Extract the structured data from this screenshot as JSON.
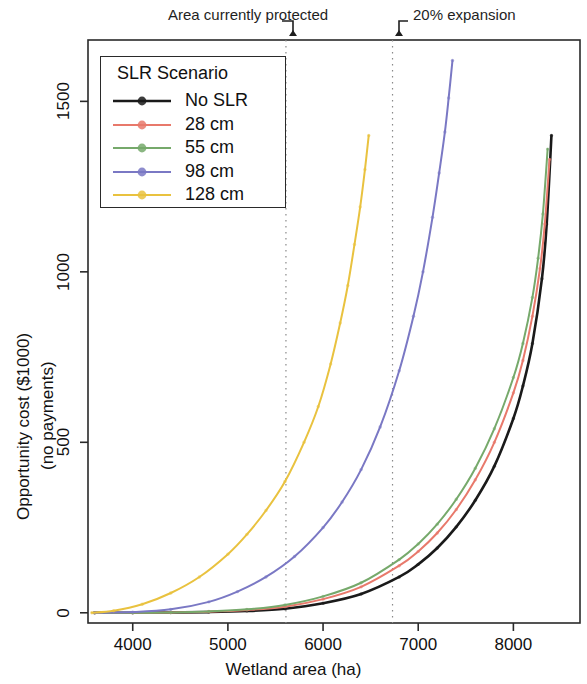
{
  "annotations": {
    "protected": "Area currently protected",
    "expansion": "20% expansion"
  },
  "axes": {
    "x_title": "Wetland area (ha)",
    "y_title_line1": "Opportunity cost ($1000)",
    "y_title_line2": "(no payments)",
    "x_ticks": [
      "4000",
      "5000",
      "6000",
      "7000",
      "8000"
    ],
    "y_ticks": [
      "0",
      "500",
      "1000",
      "1500"
    ]
  },
  "legend": {
    "title": "SLR Scenario",
    "items": [
      {
        "label": "No SLR",
        "color": "#1a1a1a"
      },
      {
        "label": "28 cm",
        "color": "#e8796b"
      },
      {
        "label": "55 cm",
        "color": "#76a96b"
      },
      {
        "label": "98 cm",
        "color": "#7a78c4"
      },
      {
        "label": "128 cm",
        "color": "#e9c23f"
      }
    ]
  },
  "chart_data": {
    "type": "line",
    "title": "",
    "xlabel": "Wetland area (ha)",
    "ylabel": "Opportunity cost ($1000) (no payments)",
    "xlim": [
      3530,
      8700
    ],
    "ylim": [
      -30,
      1680
    ],
    "grid": false,
    "legend_position": "top-left",
    "legend_title": "SLR Scenario",
    "reference_lines": [
      {
        "label": "Area currently protected",
        "x": 5610,
        "style": "dotted"
      },
      {
        "label": "20% expansion",
        "x": 6730,
        "style": "dotted"
      }
    ],
    "series": [
      {
        "name": "No SLR",
        "color": "#1a1a1a",
        "x": [
          3600,
          4000,
          4400,
          4800,
          5200,
          5600,
          6000,
          6400,
          6800,
          7000,
          7200,
          7400,
          7600,
          7800,
          8000,
          8100,
          8200,
          8300,
          8350,
          8400
        ],
        "y": [
          0,
          0,
          1,
          2,
          5,
          12,
          28,
          55,
          105,
          142,
          190,
          252,
          330,
          430,
          570,
          665,
          790,
          980,
          1140,
          1400
        ]
      },
      {
        "name": "28 cm",
        "color": "#e8796b",
        "x": [
          3600,
          4000,
          4400,
          4800,
          5200,
          5600,
          6000,
          6400,
          6800,
          7000,
          7200,
          7400,
          7600,
          7800,
          8000,
          8100,
          8200,
          8280,
          8330,
          8380
        ],
        "y": [
          0,
          0,
          1,
          3,
          8,
          18,
          40,
          76,
          138,
          180,
          234,
          303,
          390,
          500,
          645,
          740,
          870,
          1010,
          1140,
          1330
        ]
      },
      {
        "name": "55 cm",
        "color": "#76a96b",
        "x": [
          3600,
          4000,
          4400,
          4800,
          5200,
          5600,
          6000,
          6400,
          6800,
          7000,
          7200,
          7400,
          7600,
          7800,
          8000,
          8100,
          8200,
          8260,
          8310,
          8360
        ],
        "y": [
          0,
          0,
          1,
          4,
          10,
          23,
          48,
          88,
          156,
          202,
          260,
          333,
          424,
          540,
          690,
          790,
          925,
          1040,
          1170,
          1360
        ]
      },
      {
        "name": "98 cm",
        "color": "#7a78c4",
        "x": [
          3600,
          4000,
          4400,
          4800,
          5100,
          5400,
          5700,
          6000,
          6200,
          6400,
          6600,
          6800,
          6950,
          7050,
          7150,
          7220,
          7280,
          7320,
          7360
        ],
        "y": [
          0,
          2,
          10,
          32,
          62,
          105,
          165,
          250,
          325,
          420,
          545,
          710,
          870,
          1000,
          1160,
          1290,
          1410,
          1510,
          1620
        ]
      },
      {
        "name": "128 cm",
        "color": "#e9c23f",
        "x": [
          3570,
          3800,
          4100,
          4400,
          4700,
          5000,
          5200,
          5400,
          5600,
          5800,
          5950,
          6080,
          6180,
          6260,
          6330,
          6390,
          6440,
          6480
        ],
        "y": [
          0,
          6,
          25,
          58,
          105,
          172,
          230,
          300,
          385,
          500,
          605,
          730,
          850,
          960,
          1080,
          1190,
          1300,
          1400
        ]
      }
    ]
  }
}
